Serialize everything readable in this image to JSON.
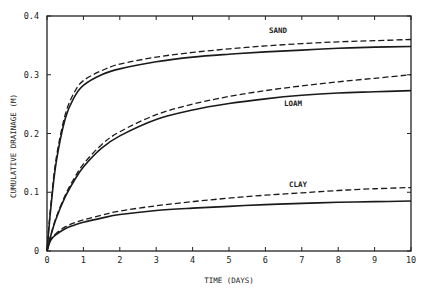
{
  "chart_data": {
    "type": "line",
    "title": "",
    "xlabel": "TIME (DAYS)",
    "ylabel": "CUMULATIVE DRAINAGE (M)",
    "xlim": [
      0,
      10
    ],
    "ylim": [
      0,
      0.4
    ],
    "xticks": [
      "0",
      "1",
      "2",
      "3",
      "4",
      "5",
      "6",
      "7",
      "8",
      "9",
      "10"
    ],
    "yticks": [
      "0",
      "0.1",
      "0.2",
      "0.3",
      "0.4"
    ],
    "grid": false,
    "legend": "inline labels",
    "x": [
      0,
      0.1,
      0.25,
      0.5,
      0.75,
      1,
      1.5,
      2,
      3,
      4,
      5,
      6,
      7,
      8,
      9,
      10
    ],
    "series": [
      {
        "name": "SAND (solid)",
        "style": "solid",
        "group": "SAND",
        "values": [
          0,
          0.07,
          0.15,
          0.225,
          0.262,
          0.282,
          0.3,
          0.31,
          0.322,
          0.33,
          0.335,
          0.339,
          0.342,
          0.345,
          0.347,
          0.348
        ]
      },
      {
        "name": "SAND (dashed)",
        "style": "dashed",
        "group": "SAND",
        "values": [
          0,
          0.075,
          0.157,
          0.232,
          0.27,
          0.29,
          0.307,
          0.318,
          0.33,
          0.338,
          0.344,
          0.349,
          0.353,
          0.356,
          0.358,
          0.36
        ]
      },
      {
        "name": "LOAM (solid)",
        "style": "solid",
        "group": "LOAM",
        "values": [
          0,
          0.025,
          0.055,
          0.092,
          0.12,
          0.143,
          0.175,
          0.196,
          0.224,
          0.24,
          0.251,
          0.259,
          0.265,
          0.269,
          0.271,
          0.273
        ]
      },
      {
        "name": "LOAM (dashed)",
        "style": "dashed",
        "group": "LOAM",
        "values": [
          0,
          0.026,
          0.057,
          0.095,
          0.124,
          0.148,
          0.181,
          0.203,
          0.232,
          0.25,
          0.263,
          0.273,
          0.281,
          0.288,
          0.294,
          0.3
        ]
      },
      {
        "name": "CLAY (solid)",
        "style": "solid",
        "group": "CLAY",
        "values": [
          0,
          0.018,
          0.028,
          0.038,
          0.044,
          0.049,
          0.056,
          0.062,
          0.069,
          0.073,
          0.076,
          0.079,
          0.081,
          0.083,
          0.084,
          0.085
        ]
      },
      {
        "name": "CLAY (dashed)",
        "style": "dashed",
        "group": "CLAY",
        "values": [
          0,
          0.019,
          0.03,
          0.041,
          0.048,
          0.053,
          0.061,
          0.068,
          0.077,
          0.084,
          0.09,
          0.095,
          0.099,
          0.103,
          0.106,
          0.108
        ]
      }
    ],
    "annotations": [
      {
        "text": "SAND",
        "x": 6.1,
        "y": 0.365
      },
      {
        "text": "LOAM",
        "x": 6.0,
        "y": 0.253
      },
      {
        "text": "CLAY",
        "x": 6.1,
        "y": 0.114
      }
    ]
  },
  "labels": {
    "xlabel": "TIME (DAYS)",
    "ylabel": "CUMULATIVE DRAINAGE (M)",
    "sand": "SAND",
    "loam": "LOAM",
    "clay": "CLAY"
  },
  "colors": {
    "line": "#1a1a1a",
    "axis": "#222222",
    "background": "#ffffff"
  }
}
